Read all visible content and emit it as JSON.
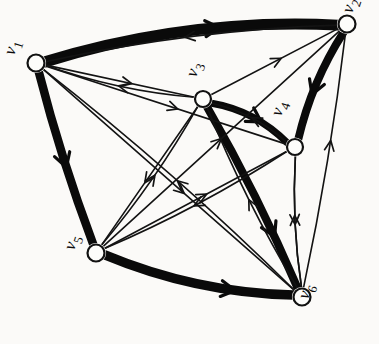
{
  "diagram": {
    "style": "hand-drawn ink on paper",
    "background_color": "#fbfaf8",
    "ink_color": "#111111",
    "width": 379,
    "height": 344,
    "label_rotation_deg": -72,
    "nodes": [
      {
        "id": "v1",
        "label_base": "v",
        "label_sub": "1",
        "x": 36,
        "y": 63,
        "r": 8.5,
        "label_x": 14,
        "label_y": 56
      },
      {
        "id": "v2",
        "label_base": "v",
        "label_sub": "2",
        "x": 347,
        "y": 24,
        "r": 8.5,
        "label_x": 352,
        "label_y": 14
      },
      {
        "id": "v3",
        "label_base": "v",
        "label_sub": "3",
        "x": 203,
        "y": 99,
        "r": 8.0,
        "label_x": 196,
        "label_y": 78
      },
      {
        "id": "v4",
        "label_base": "v",
        "label_sub": "4",
        "x": 295,
        "y": 147,
        "r": 8.0,
        "label_x": 281,
        "label_y": 117
      },
      {
        "id": "v5",
        "label_base": "v",
        "label_sub": "5",
        "x": 96,
        "y": 253,
        "r": 8.5,
        "label_x": 74,
        "label_y": 251
      },
      {
        "id": "v6",
        "label_base": "v",
        "label_sub": "6",
        "x": 302,
        "y": 297,
        "r": 8.5,
        "label_x": 308,
        "label_y": 300
      }
    ],
    "edges": [
      {
        "from": "v1",
        "to": "v2",
        "weight": "thick",
        "width": 11.0,
        "curve": -26,
        "arrow_at": 0.6
      },
      {
        "from": "v1",
        "to": "v5",
        "weight": "thick",
        "width": 8.5,
        "curve": 5,
        "arrow_at": 0.55
      },
      {
        "from": "v5",
        "to": "v6",
        "weight": "thick",
        "width": 9.5,
        "curve": 18,
        "arrow_at": 0.7
      },
      {
        "from": "v2",
        "to": "v4",
        "weight": "thick",
        "width": 8.0,
        "curve": 10,
        "arrow_at": 0.6
      },
      {
        "from": "v3",
        "to": "v6",
        "weight": "thick",
        "width": 8.0,
        "curve": -6,
        "arrow_at": 0.72
      },
      {
        "from": "v3",
        "to": "v4",
        "weight": "thick",
        "width": 7.0,
        "curve": -14,
        "arrow_at": 0.62
      },
      {
        "from": "v2",
        "to": "v1",
        "weight": "thin",
        "width": 1.6,
        "curve": 14,
        "arrow_at": 0.52
      },
      {
        "from": "v1",
        "to": "v3",
        "weight": "thin",
        "width": 1.6,
        "curve": 0,
        "arrow_at": 0.58
      },
      {
        "from": "v1",
        "to": "v4",
        "weight": "thin",
        "width": 1.6,
        "curve": 0,
        "arrow_at": 0.55
      },
      {
        "from": "v1",
        "to": "v6",
        "weight": "thin",
        "width": 1.6,
        "curve": 0,
        "arrow_at": 0.56
      },
      {
        "from": "v3",
        "to": "v1",
        "weight": "thin",
        "width": 1.6,
        "curve": -10,
        "arrow_at": 0.5
      },
      {
        "from": "v3",
        "to": "v2",
        "weight": "thin",
        "width": 1.6,
        "curve": 0,
        "arrow_at": 0.55
      },
      {
        "from": "v3",
        "to": "v5",
        "weight": "thin",
        "width": 1.6,
        "curve": 0,
        "arrow_at": 0.55
      },
      {
        "from": "v5",
        "to": "v2",
        "weight": "thin",
        "width": 1.6,
        "curve": 0,
        "arrow_at": 0.5
      },
      {
        "from": "v5",
        "to": "v3",
        "weight": "thin",
        "width": 1.6,
        "curve": 8,
        "arrow_at": 0.52
      },
      {
        "from": "v5",
        "to": "v4",
        "weight": "thin",
        "width": 1.6,
        "curve": 0,
        "arrow_at": 0.56
      },
      {
        "from": "v6",
        "to": "v1",
        "weight": "thin",
        "width": 1.6,
        "curve": 10,
        "arrow_at": 0.48
      },
      {
        "from": "v6",
        "to": "v2",
        "weight": "thin",
        "width": 1.6,
        "curve": 6,
        "arrow_at": 0.58
      },
      {
        "from": "v6",
        "to": "v3",
        "weight": "thin",
        "width": 1.6,
        "curve": -8,
        "arrow_at": 0.5
      },
      {
        "from": "v6",
        "to": "v4",
        "weight": "thin",
        "width": 1.6,
        "curve": -7,
        "arrow_at": 0.55
      },
      {
        "from": "v4",
        "to": "v6",
        "weight": "thin",
        "width": 1.6,
        "curve": 7,
        "arrow_at": 0.52
      },
      {
        "from": "v4",
        "to": "v5",
        "weight": "thin",
        "width": 1.6,
        "curve": -9,
        "arrow_at": 0.52
      },
      {
        "from": "v4",
        "to": "v3",
        "weight": "thin",
        "width": 1.6,
        "curve": 12,
        "arrow_at": 0.5
      }
    ]
  }
}
